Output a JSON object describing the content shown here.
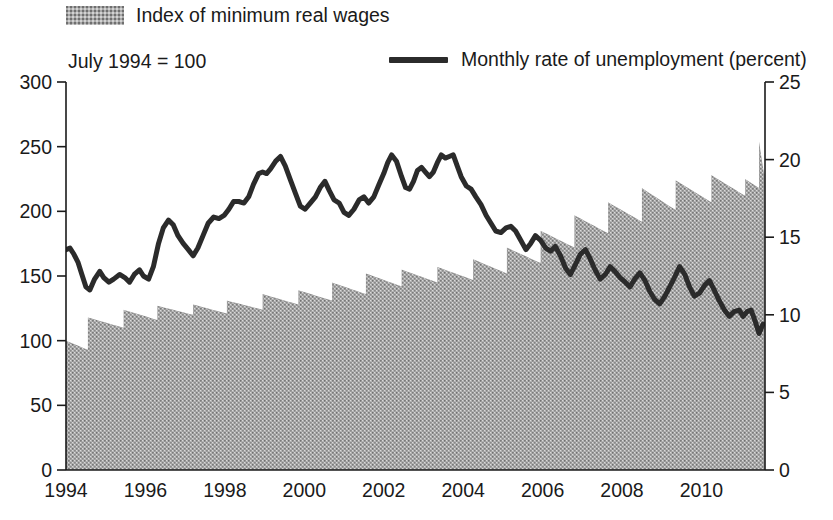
{
  "legend": {
    "bars_label": "Index of minimum real wages",
    "line_label": "Monthly rate of unemployment (percent)",
    "bars_swatch_icon": "hatched-gray-swatch-icon",
    "line_swatch_icon": "thick-black-rule-icon",
    "bars_color": "#a9a9a9",
    "line_color": "#2b2b2b"
  },
  "axis_note": "July 1994 = 100",
  "chart_data": {
    "type": "bar",
    "title": "",
    "subtitle": "July 1994 = 100",
    "xlabel": "",
    "ylabel": "",
    "grid": false,
    "legend_position": "top",
    "x": [
      1994.0,
      1994.5,
      1995.0,
      1995.5,
      1996.0,
      1996.5,
      1997.0,
      1997.5,
      1998.0,
      1998.5,
      1999.0,
      1999.5,
      2000.0,
      2000.5,
      2001.0,
      2001.5,
      2002.0,
      2002.5,
      2003.0,
      2003.5,
      2004.0,
      2004.5,
      2005.0,
      2005.5,
      2006.0,
      2006.5,
      2007.0,
      2007.5,
      2008.0,
      2008.5,
      2009.0,
      2009.5,
      2010.0,
      2010.5,
      2011.0,
      2011.5
    ],
    "xlim": [
      1994.0,
      2011.6
    ],
    "xticks": [
      1994,
      1996,
      1998,
      2000,
      2002,
      2004,
      2006,
      2008,
      2010
    ],
    "xticklabels": [
      "1994",
      "1996",
      "1998",
      "2000",
      "2002",
      "2004",
      "2006",
      "2008",
      "2010"
    ],
    "left_axis": {
      "name": "Index of minimum real wages",
      "ylim": [
        0,
        300
      ],
      "yticks": [
        0,
        50,
        100,
        150,
        200,
        250,
        300
      ],
      "yticklabels": [
        "0",
        "50",
        "100",
        "150",
        "200",
        "250",
        "300"
      ],
      "note": "July 1994 = 100"
    },
    "right_axis": {
      "name": "Monthly rate of unemployment (percent)",
      "ylim": [
        0,
        25
      ],
      "yticks": [
        0,
        5,
        10,
        15,
        20,
        25
      ],
      "yticklabels": [
        "0",
        "5",
        "10",
        "15",
        "20",
        "25"
      ]
    },
    "series": [
      {
        "name": "Index of minimum real wages",
        "type": "bar",
        "axis": "left",
        "color": "#a9a9a9",
        "pattern": "stipple",
        "note": "Sawtooth: steps up at each nominal adjustment, then erodes with inflation.",
        "segments": [
          {
            "start": 1994.0,
            "end": 1994.55,
            "top": 100,
            "bottom": 93
          },
          {
            "start": 1994.55,
            "end": 1995.45,
            "top": 118,
            "bottom": 110
          },
          {
            "start": 1995.45,
            "end": 1996.3,
            "top": 124,
            "bottom": 116
          },
          {
            "start": 1996.3,
            "end": 1997.2,
            "top": 127,
            "bottom": 120
          },
          {
            "start": 1997.2,
            "end": 1998.05,
            "top": 128,
            "bottom": 121
          },
          {
            "start": 1998.05,
            "end": 1998.95,
            "top": 131,
            "bottom": 124
          },
          {
            "start": 1998.95,
            "end": 1999.85,
            "top": 136,
            "bottom": 128
          },
          {
            "start": 1999.85,
            "end": 2000.7,
            "top": 139,
            "bottom": 131
          },
          {
            "start": 2000.7,
            "end": 2001.55,
            "top": 145,
            "bottom": 136
          },
          {
            "start": 2001.55,
            "end": 2002.45,
            "top": 152,
            "bottom": 142
          },
          {
            "start": 2002.45,
            "end": 2003.35,
            "top": 155,
            "bottom": 145
          },
          {
            "start": 2003.35,
            "end": 2004.25,
            "top": 157,
            "bottom": 147
          },
          {
            "start": 2004.25,
            "end": 2005.1,
            "top": 163,
            "bottom": 152
          },
          {
            "start": 2005.1,
            "end": 2005.95,
            "top": 172,
            "bottom": 160
          },
          {
            "start": 2005.95,
            "end": 2006.8,
            "top": 185,
            "bottom": 172
          },
          {
            "start": 2006.8,
            "end": 2007.65,
            "top": 197,
            "bottom": 183
          },
          {
            "start": 2007.65,
            "end": 2008.5,
            "top": 207,
            "bottom": 192
          },
          {
            "start": 2008.5,
            "end": 2009.35,
            "top": 218,
            "bottom": 201
          },
          {
            "start": 2009.35,
            "end": 2010.25,
            "top": 224,
            "bottom": 207
          },
          {
            "start": 2010.25,
            "end": 2011.1,
            "top": 228,
            "bottom": 212
          },
          {
            "start": 2011.1,
            "end": 2011.45,
            "top": 225,
            "bottom": 218
          },
          {
            "start": 2011.45,
            "end": 2011.58,
            "top": 254,
            "bottom": 228
          }
        ]
      },
      {
        "name": "Monthly rate of unemployment (percent)",
        "type": "line",
        "axis": "right",
        "color": "#2b2b2b",
        "linewidth": 5,
        "points": [
          [
            1994.0,
            14.2
          ],
          [
            1994.1,
            14.3
          ],
          [
            1994.2,
            13.9
          ],
          [
            1994.3,
            13.4
          ],
          [
            1994.4,
            12.6
          ],
          [
            1994.5,
            11.8
          ],
          [
            1994.6,
            11.6
          ],
          [
            1994.72,
            12.3
          ],
          [
            1994.85,
            12.8
          ],
          [
            1994.95,
            12.4
          ],
          [
            1995.08,
            12.1
          ],
          [
            1995.2,
            12.3
          ],
          [
            1995.35,
            12.6
          ],
          [
            1995.48,
            12.4
          ],
          [
            1995.6,
            12.1
          ],
          [
            1995.72,
            12.6
          ],
          [
            1995.85,
            12.9
          ],
          [
            1995.95,
            12.5
          ],
          [
            1996.08,
            12.3
          ],
          [
            1996.2,
            13.1
          ],
          [
            1996.33,
            14.6
          ],
          [
            1996.45,
            15.6
          ],
          [
            1996.58,
            16.1
          ],
          [
            1996.7,
            15.8
          ],
          [
            1996.82,
            15.1
          ],
          [
            1996.95,
            14.6
          ],
          [
            1997.08,
            14.2
          ],
          [
            1997.2,
            13.8
          ],
          [
            1997.32,
            14.3
          ],
          [
            1997.45,
            15.1
          ],
          [
            1997.58,
            15.9
          ],
          [
            1997.72,
            16.3
          ],
          [
            1997.85,
            16.2
          ],
          [
            1997.98,
            16.4
          ],
          [
            1998.1,
            16.8
          ],
          [
            1998.22,
            17.3
          ],
          [
            1998.35,
            17.3
          ],
          [
            1998.48,
            17.2
          ],
          [
            1998.6,
            17.6
          ],
          [
            1998.72,
            18.4
          ],
          [
            1998.85,
            19.1
          ],
          [
            1998.95,
            19.2
          ],
          [
            1999.05,
            19.1
          ],
          [
            1999.15,
            19.4
          ],
          [
            1999.28,
            19.9
          ],
          [
            1999.4,
            20.2
          ],
          [
            1999.52,
            19.6
          ],
          [
            1999.65,
            18.7
          ],
          [
            1999.78,
            17.8
          ],
          [
            1999.9,
            17.0
          ],
          [
            2000.02,
            16.8
          ],
          [
            2000.15,
            17.2
          ],
          [
            2000.28,
            17.6
          ],
          [
            2000.4,
            18.2
          ],
          [
            2000.52,
            18.6
          ],
          [
            2000.63,
            18.0
          ],
          [
            2000.75,
            17.4
          ],
          [
            2000.88,
            17.2
          ],
          [
            2001.0,
            16.6
          ],
          [
            2001.12,
            16.4
          ],
          [
            2001.25,
            16.8
          ],
          [
            2001.38,
            17.4
          ],
          [
            2001.5,
            17.6
          ],
          [
            2001.62,
            17.2
          ],
          [
            2001.75,
            17.6
          ],
          [
            2001.88,
            18.4
          ],
          [
            2002.0,
            19.1
          ],
          [
            2002.1,
            19.8
          ],
          [
            2002.2,
            20.3
          ],
          [
            2002.32,
            19.9
          ],
          [
            2002.45,
            18.9
          ],
          [
            2002.55,
            18.2
          ],
          [
            2002.65,
            18.1
          ],
          [
            2002.75,
            18.6
          ],
          [
            2002.85,
            19.3
          ],
          [
            2002.95,
            19.5
          ],
          [
            2003.05,
            19.2
          ],
          [
            2003.15,
            18.9
          ],
          [
            2003.25,
            19.2
          ],
          [
            2003.35,
            19.8
          ],
          [
            2003.45,
            20.3
          ],
          [
            2003.55,
            20.1
          ],
          [
            2003.65,
            20.2
          ],
          [
            2003.75,
            20.3
          ],
          [
            2003.85,
            19.6
          ],
          [
            2003.95,
            18.9
          ],
          [
            2004.08,
            18.3
          ],
          [
            2004.2,
            18.1
          ],
          [
            2004.32,
            17.6
          ],
          [
            2004.45,
            17.1
          ],
          [
            2004.58,
            16.4
          ],
          [
            2004.7,
            15.9
          ],
          [
            2004.82,
            15.4
          ],
          [
            2004.95,
            15.3
          ],
          [
            2005.08,
            15.6
          ],
          [
            2005.2,
            15.7
          ],
          [
            2005.32,
            15.4
          ],
          [
            2005.45,
            14.8
          ],
          [
            2005.58,
            14.2
          ],
          [
            2005.7,
            14.6
          ],
          [
            2005.82,
            15.1
          ],
          [
            2005.95,
            14.8
          ],
          [
            2006.08,
            14.3
          ],
          [
            2006.2,
            14.1
          ],
          [
            2006.32,
            14.4
          ],
          [
            2006.45,
            13.8
          ],
          [
            2006.58,
            13.0
          ],
          [
            2006.7,
            12.6
          ],
          [
            2006.82,
            13.2
          ],
          [
            2006.95,
            13.9
          ],
          [
            2007.08,
            14.2
          ],
          [
            2007.2,
            13.6
          ],
          [
            2007.32,
            12.9
          ],
          [
            2007.45,
            12.3
          ],
          [
            2007.58,
            12.6
          ],
          [
            2007.7,
            13.1
          ],
          [
            2007.82,
            12.8
          ],
          [
            2007.95,
            12.4
          ],
          [
            2008.08,
            12.1
          ],
          [
            2008.2,
            11.8
          ],
          [
            2008.32,
            12.3
          ],
          [
            2008.45,
            12.7
          ],
          [
            2008.58,
            12.2
          ],
          [
            2008.7,
            11.5
          ],
          [
            2008.82,
            11.0
          ],
          [
            2008.95,
            10.7
          ],
          [
            2009.08,
            11.2
          ],
          [
            2009.2,
            11.8
          ],
          [
            2009.32,
            12.4
          ],
          [
            2009.45,
            13.1
          ],
          [
            2009.58,
            12.6
          ],
          [
            2009.7,
            11.8
          ],
          [
            2009.82,
            11.2
          ],
          [
            2009.95,
            11.4
          ],
          [
            2010.08,
            11.9
          ],
          [
            2010.2,
            12.2
          ],
          [
            2010.32,
            11.6
          ],
          [
            2010.45,
            10.9
          ],
          [
            2010.58,
            10.3
          ],
          [
            2010.7,
            9.9
          ],
          [
            2010.82,
            10.2
          ],
          [
            2010.95,
            10.3
          ],
          [
            2011.05,
            9.9
          ],
          [
            2011.15,
            10.2
          ],
          [
            2011.25,
            10.3
          ],
          [
            2011.35,
            9.6
          ],
          [
            2011.45,
            8.8
          ],
          [
            2011.55,
            9.4
          ]
        ]
      }
    ]
  }
}
